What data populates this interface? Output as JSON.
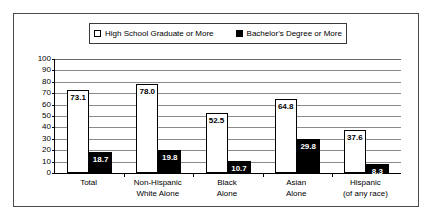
{
  "chart_data": {
    "type": "bar",
    "title": "",
    "subtitle": "",
    "xlabel": "",
    "ylabel": "",
    "ylim": [
      0,
      100
    ],
    "ytick_step": 10,
    "yticks": [
      "100",
      "90",
      "80",
      "70",
      "60",
      "50",
      "40",
      "30",
      "20",
      "10",
      "0"
    ],
    "grid": true,
    "legend_position": "top-center",
    "categories": [
      "Total",
      "Non-Hispanic White Alone",
      "Black Alone",
      "Asian Alone",
      "Hispanic (of any race)"
    ],
    "category_lines": [
      [
        "Total",
        ""
      ],
      [
        "Non-Hispanic",
        "White Alone"
      ],
      [
        "Black",
        "Alone"
      ],
      [
        "Asian",
        "Alone"
      ],
      [
        "Hispanic",
        "(of any race)"
      ]
    ],
    "series": [
      {
        "name": "High School Graduate or More",
        "color": "#ffffff",
        "values": [
          73.1,
          78.0,
          52.5,
          64.8,
          37.6
        ],
        "labels": [
          "73.1",
          "78.0",
          "52.5",
          "64.8",
          "37.6"
        ]
      },
      {
        "name": "Bachelor's Degree or More",
        "color": "#000000",
        "values": [
          18.7,
          19.8,
          10.7,
          29.8,
          8.3
        ],
        "labels": [
          "18.7",
          "19.8",
          "10.7",
          "29.8",
          "8.3"
        ]
      }
    ]
  },
  "legend": {
    "items": [
      {
        "label": "High School Graduate or More",
        "swatch": "hollow"
      },
      {
        "label": "Bachelor's Degree or More",
        "swatch": "filled"
      }
    ]
  }
}
